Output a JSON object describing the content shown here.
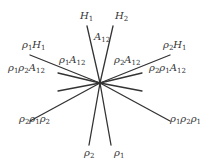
{
  "diagram": {
    "type": "line-arrangement",
    "center": [
      100,
      83
    ],
    "stroke_color": "#333333",
    "lines": [
      {
        "id": "H1",
        "end": [
          87,
          26
        ]
      },
      {
        "id": "H2",
        "end": [
          113,
          26
        ]
      },
      {
        "id": "rho1H1",
        "end": [
          30,
          55
        ]
      },
      {
        "id": "rho2H1",
        "end": [
          170,
          55
        ]
      },
      {
        "id": "left-upper-short",
        "end": [
          58,
          73
        ]
      },
      {
        "id": "left-lower-short",
        "end": [
          58,
          91
        ]
      },
      {
        "id": "right-upper-short",
        "end": [
          142,
          73
        ]
      },
      {
        "id": "right-lower-short",
        "end": [
          142,
          91
        ]
      },
      {
        "id": "rho2rho1rho2",
        "end": [
          30,
          121
        ]
      },
      {
        "id": "rho1rho2rho1",
        "end": [
          170,
          121
        ]
      },
      {
        "id": "rho2",
        "end": [
          89,
          145
        ]
      },
      {
        "id": "rho1",
        "end": [
          111,
          145
        ]
      }
    ],
    "labels": [
      {
        "id": "H1",
        "base": "H",
        "sub": "1",
        "x": 80,
        "y": 12
      },
      {
        "id": "H2",
        "base": "H",
        "sub": "2",
        "x": 114,
        "y": 12
      },
      {
        "id": "A12",
        "base": "A",
        "sub": "12",
        "x": 93,
        "y": 34
      },
      {
        "id": "rho1H1",
        "base": "ρ",
        "sub": "1",
        "base2": "H",
        "sub2": "1",
        "x": 22,
        "y": 41
      },
      {
        "id": "rho1A12",
        "base": "ρ",
        "sub": "1",
        "base2": "A",
        "sub2": "12",
        "x": 58,
        "y": 56
      },
      {
        "id": "rho1rho2A12",
        "base": "ρ",
        "sub": "1",
        "base2": "ρ",
        "sub2": "2",
        "base3": "A",
        "sub3": "12",
        "x": 8,
        "y": 64
      },
      {
        "id": "rho2H1",
        "base": "ρ",
        "sub": "2",
        "base2": "H",
        "sub2": "1",
        "x": 164,
        "y": 41
      },
      {
        "id": "rho2A12",
        "base": "ρ",
        "sub": "2",
        "base2": "A",
        "sub2": "12",
        "x": 114,
        "y": 56
      },
      {
        "id": "rho2rho1A12",
        "base": "ρ",
        "sub": "2",
        "base2": "ρ",
        "sub2": "1",
        "base3": "A",
        "sub3": "12",
        "x": 150,
        "y": 64
      },
      {
        "id": "rho2rho1rho2",
        "base": "ρ",
        "sub": "2",
        "base2": "ρ",
        "sub2": "1",
        "base3": "ρ",
        "sub3": "2",
        "x": 20,
        "y": 114
      },
      {
        "id": "rho1rho2rho1",
        "base": "ρ",
        "sub": "1",
        "base2": "ρ",
        "sub2": "2",
        "base3": "ρ",
        "sub3": "1",
        "x": 170,
        "y": 114
      },
      {
        "id": "rho2",
        "base": "ρ",
        "sub": "2",
        "x": 84,
        "y": 148
      },
      {
        "id": "rho1",
        "base": "ρ",
        "sub": "1",
        "x": 113,
        "y": 148
      }
    ]
  },
  "text": {
    "H1": {
      "b": "H",
      "s": "1"
    },
    "H2": {
      "b": "H",
      "s": "2"
    },
    "A12": {
      "b": "A",
      "s": "12"
    },
    "rho1H1": {
      "b1": "ρ",
      "s1": "1",
      "b2": "H",
      "s2": "1"
    },
    "rho1A12": {
      "b1": "ρ",
      "s1": "1",
      "b2": "A",
      "s2": "12"
    },
    "rho1rho2A12": {
      "b1": "ρ",
      "s1": "1",
      "b2": "ρ",
      "s2": "2",
      "b3": "A",
      "s3": "12"
    },
    "rho2H1": {
      "b1": "ρ",
      "s1": "2",
      "b2": "H",
      "s2": "1"
    },
    "rho2A12": {
      "b1": "ρ",
      "s1": "2",
      "b2": "A",
      "s2": "12"
    },
    "rho2rho1A12": {
      "b1": "ρ",
      "s1": "2",
      "b2": "ρ",
      "s2": "1",
      "b3": "A",
      "s3": "12"
    },
    "rho2rho1rho2": {
      "b1": "ρ",
      "s1": "2",
      "b2": "ρ",
      "s2": "1",
      "b3": "ρ",
      "s3": "2"
    },
    "rho1rho2rho1": {
      "b1": "ρ",
      "s1": "1",
      "b2": "ρ",
      "s2": "2",
      "b3": "ρ",
      "s3": "1"
    },
    "rho2": {
      "b": "ρ",
      "s": "2"
    },
    "rho1": {
      "b": "ρ",
      "s": "1"
    }
  }
}
